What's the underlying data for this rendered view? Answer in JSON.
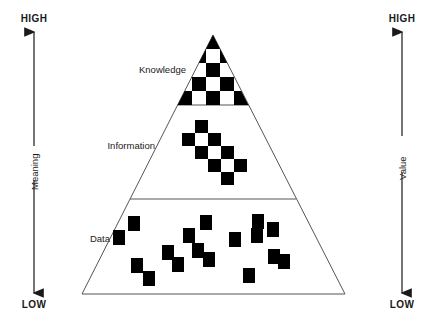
{
  "diagram": {
    "type": "pyramid",
    "title": "",
    "background_color": "#ffffff",
    "line_color": "#555555",
    "fill_color": "#000000",
    "text_color": "#1a1a1a"
  },
  "left_axis": {
    "name": "left-axis",
    "label": "Meaning",
    "top_cap": "HIGH",
    "bottom_cap": "LOW",
    "direction": "bidirectional-vertical"
  },
  "right_axis": {
    "name": "right-axis",
    "label": "Value",
    "top_cap": "HIGH",
    "bottom_cap": "LOW",
    "direction": "bidirectional-vertical"
  },
  "tiers": [
    {
      "id": "knowledge",
      "label": "Knowledge",
      "order": 1,
      "position": "top",
      "pattern": "dense-checkerboard",
      "label_x": 186,
      "label_y": 70
    },
    {
      "id": "information",
      "label": "Information",
      "order": 2,
      "position": "middle",
      "pattern": "sparse-diagonal-checkerboard",
      "label_x": 155,
      "label_y": 146
    },
    {
      "id": "data",
      "label": "Data",
      "order": 3,
      "position": "bottom",
      "pattern": "scattered-squares",
      "label_x": 110,
      "label_y": 239
    }
  ],
  "geometry": {
    "apex_x": 213,
    "apex_y": 35,
    "base_left_x": 82,
    "base_right_x": 345,
    "base_y": 294,
    "divider_knowledge_y": 105,
    "divider_information_y": 199
  },
  "chart_data": {
    "type": "diagram",
    "knowledge_cells": [
      [
        206,
        35,
        14,
        14
      ],
      [
        192,
        49,
        14,
        14
      ],
      [
        220,
        49,
        14,
        14
      ],
      [
        178,
        63,
        14,
        14
      ],
      [
        206,
        63,
        14,
        14
      ],
      [
        234,
        63,
        14,
        14
      ],
      [
        192,
        77,
        14,
        14
      ],
      [
        220,
        77,
        14,
        14
      ],
      [
        164,
        77,
        14,
        14
      ],
      [
        248,
        77,
        14,
        14
      ],
      [
        178,
        91,
        14,
        14
      ],
      [
        206,
        91,
        14,
        14
      ],
      [
        234,
        91,
        14,
        14
      ],
      [
        150,
        91,
        14,
        14
      ],
      [
        262,
        91,
        14,
        14
      ]
    ],
    "information_cells": [
      [
        195,
        120,
        13,
        13
      ],
      [
        182,
        133,
        13,
        13
      ],
      [
        208,
        133,
        13,
        13
      ],
      [
        195,
        146,
        13,
        13
      ],
      [
        221,
        146,
        13,
        13
      ],
      [
        208,
        159,
        13,
        13
      ],
      [
        234,
        159,
        13,
        13
      ],
      [
        221,
        172,
        13,
        13
      ]
    ],
    "data_squares": [
      [
        128,
        216,
        12,
        15
      ],
      [
        113,
        230,
        12,
        15
      ],
      [
        131,
        258,
        12,
        15
      ],
      [
        143,
        271,
        12,
        15
      ],
      [
        162,
        245,
        12,
        15
      ],
      [
        172,
        257,
        12,
        15
      ],
      [
        183,
        228,
        12,
        15
      ],
      [
        192,
        243,
        12,
        15
      ],
      [
        200,
        215,
        12,
        15
      ],
      [
        203,
        252,
        12,
        15
      ],
      [
        229,
        232,
        12,
        15
      ],
      [
        243,
        268,
        12,
        15
      ],
      [
        251,
        228,
        12,
        15
      ],
      [
        252,
        214,
        12,
        15
      ],
      [
        267,
        222,
        12,
        15
      ],
      [
        268,
        249,
        12,
        15
      ],
      [
        278,
        254,
        12,
        15
      ]
    ]
  }
}
